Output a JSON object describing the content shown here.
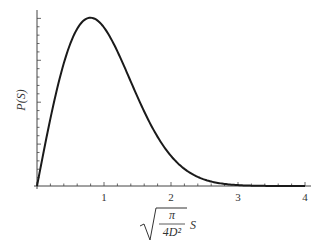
{
  "chart_data": {
    "type": "line",
    "title": "",
    "xlabel": "sqrt(π / (4D²)) S",
    "xlabel_parts": {
      "numerator": "π",
      "denominator": "4D²",
      "suffix": "S"
    },
    "ylabel": "P(S)",
    "xlim": [
      0,
      4
    ],
    "ylim": [
      0,
      0.9
    ],
    "x_ticks": [
      1,
      2,
      3,
      4
    ],
    "x_tick_labels": [
      "1",
      "2",
      "3",
      "4"
    ],
    "x_minor_per_major": 5,
    "y_minor_ticks": 20,
    "grid": false,
    "legend": "none",
    "series": [
      {
        "name": "P(S)",
        "color": "#1a1a1a",
        "function": "(pi/2) * s * exp(-pi*s^2/4)",
        "x": [
          0,
          0.2,
          0.4,
          0.6,
          0.8,
          1.0,
          1.2,
          1.4,
          1.6,
          1.8,
          2.0,
          2.2,
          2.4,
          2.6,
          2.8,
          3.0,
          3.5,
          4.0
        ],
        "y": [
          0,
          0.304,
          0.555,
          0.71,
          0.759,
          0.717,
          0.606,
          0.469,
          0.342,
          0.22,
          0.136,
          0.077,
          0.04,
          0.02,
          0.009,
          0.004,
          0.0003,
          1e-05
        ]
      }
    ]
  }
}
